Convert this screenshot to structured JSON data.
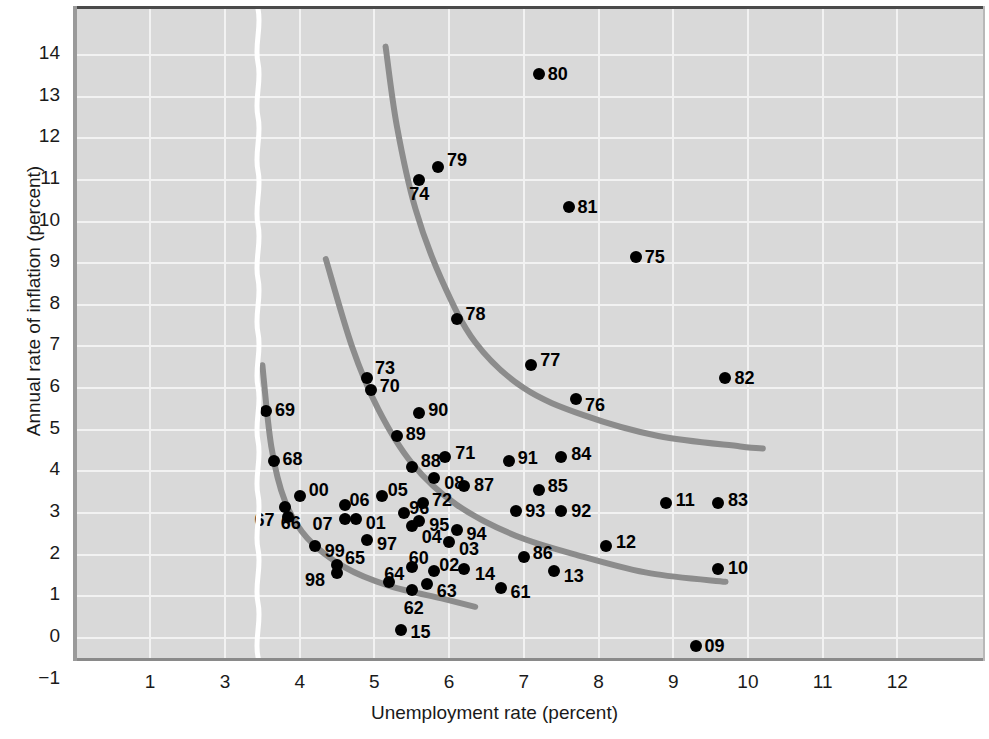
{
  "chart_data": {
    "type": "scatter",
    "title": "",
    "xlabel": "Unemployment rate (percent)",
    "ylabel": "Annual rate of inflation (percent)",
    "xlim": [
      0.4,
      12.7
    ],
    "ylim": [
      -1,
      14.7
    ],
    "xticks": [
      "1",
      "3",
      "4",
      "5",
      "6",
      "7",
      "8",
      "9",
      "10",
      "11",
      "12"
    ],
    "xtick_values": [
      1,
      3,
      4,
      5,
      6,
      7,
      8,
      9,
      10,
      11,
      12
    ],
    "yticks": [
      "14",
      "13",
      "12",
      "11",
      "10",
      "9",
      "8",
      "7",
      "6",
      "5",
      "4",
      "3",
      "2",
      "1",
      "0",
      "−1"
    ],
    "ytick_values": [
      14,
      13,
      12,
      11,
      10,
      9,
      8,
      7,
      6,
      5,
      4,
      3,
      2,
      1,
      0,
      -1
    ],
    "axis_break": {
      "present": true,
      "between": [
        1,
        3
      ],
      "style": "wavy-white-line"
    },
    "grid": true,
    "legend": null,
    "plot_bg_color": "#d9d9d9",
    "grid_color": "#f2f2f2",
    "point_color": "#000000",
    "curve_color": "#8c8c8c",
    "points": [
      {
        "label": "60",
        "x": 5.5,
        "y": 1.7
      },
      {
        "label": "61",
        "x": 6.7,
        "y": 1.2
      },
      {
        "label": "62",
        "x": 5.5,
        "y": 1.15
      },
      {
        "label": "63",
        "x": 5.7,
        "y": 1.3
      },
      {
        "label": "64",
        "x": 5.2,
        "y": 1.35
      },
      {
        "label": "65",
        "x": 4.5,
        "y": 1.75
      },
      {
        "label": "66",
        "x": 3.8,
        "y": 3.15
      },
      {
        "label": "67",
        "x": 3.85,
        "y": 2.9
      },
      {
        "label": "68",
        "x": 3.65,
        "y": 4.25
      },
      {
        "label": "69",
        "x": 3.55,
        "y": 5.45
      },
      {
        "label": "70",
        "x": 4.95,
        "y": 5.95
      },
      {
        "label": "71",
        "x": 5.95,
        "y": 4.35
      },
      {
        "label": "72",
        "x": 5.65,
        "y": 3.25
      },
      {
        "label": "73",
        "x": 4.9,
        "y": 6.25
      },
      {
        "label": "74",
        "x": 5.6,
        "y": 11.0
      },
      {
        "label": "75",
        "x": 8.5,
        "y": 9.15
      },
      {
        "label": "76",
        "x": 7.7,
        "y": 5.75
      },
      {
        "label": "77",
        "x": 7.1,
        "y": 6.55
      },
      {
        "label": "78",
        "x": 6.1,
        "y": 7.65
      },
      {
        "label": "79",
        "x": 5.85,
        "y": 11.3
      },
      {
        "label": "80",
        "x": 7.2,
        "y": 13.55
      },
      {
        "label": "81",
        "x": 7.6,
        "y": 10.35
      },
      {
        "label": "82",
        "x": 9.7,
        "y": 6.25
      },
      {
        "label": "83",
        "x": 9.6,
        "y": 3.25
      },
      {
        "label": "84",
        "x": 7.5,
        "y": 4.35
      },
      {
        "label": "85",
        "x": 7.2,
        "y": 3.55
      },
      {
        "label": "86",
        "x": 7.0,
        "y": 1.95
      },
      {
        "label": "87",
        "x": 6.2,
        "y": 3.65
      },
      {
        "label": "88",
        "x": 5.5,
        "y": 4.1
      },
      {
        "label": "89",
        "x": 5.3,
        "y": 4.85
      },
      {
        "label": "90",
        "x": 5.6,
        "y": 5.4
      },
      {
        "label": "91",
        "x": 6.8,
        "y": 4.25
      },
      {
        "label": "92",
        "x": 7.5,
        "y": 3.05
      },
      {
        "label": "93",
        "x": 6.9,
        "y": 3.05
      },
      {
        "label": "94",
        "x": 6.1,
        "y": 2.6
      },
      {
        "label": "95",
        "x": 5.6,
        "y": 2.8
      },
      {
        "label": "96",
        "x": 5.4,
        "y": 3.0
      },
      {
        "label": "97",
        "x": 4.9,
        "y": 2.35
      },
      {
        "label": "98",
        "x": 4.5,
        "y": 1.55
      },
      {
        "label": "99",
        "x": 4.2,
        "y": 2.2
      },
      {
        "label": "00",
        "x": 4.0,
        "y": 3.4
      },
      {
        "label": "01",
        "x": 4.75,
        "y": 2.85
      },
      {
        "label": "02",
        "x": 5.8,
        "y": 1.6
      },
      {
        "label": "03",
        "x": 6.0,
        "y": 2.3
      },
      {
        "label": "04",
        "x": 5.5,
        "y": 2.7
      },
      {
        "label": "05",
        "x": 5.1,
        "y": 3.4
      },
      {
        "label": "06",
        "x": 4.6,
        "y": 3.2
      },
      {
        "label": "07",
        "x": 4.6,
        "y": 2.85
      },
      {
        "label": "08",
        "x": 5.8,
        "y": 3.85
      },
      {
        "label": "09",
        "x": 9.3,
        "y": -0.2
      },
      {
        "label": "10",
        "x": 9.6,
        "y": 1.65
      },
      {
        "label": "11",
        "x": 8.9,
        "y": 3.25
      },
      {
        "label": "12",
        "x": 8.1,
        "y": 2.2
      },
      {
        "label": "13",
        "x": 7.4,
        "y": 1.6
      },
      {
        "label": "14",
        "x": 6.2,
        "y": 1.65
      },
      {
        "label": "15",
        "x": 5.35,
        "y": 0.2
      }
    ],
    "curves": [
      {
        "name": "short-run-phillips-curve-1960s",
        "points": [
          [
            3.5,
            6.55
          ],
          [
            3.62,
            4.6
          ],
          [
            3.8,
            3.3
          ],
          [
            4.1,
            2.4
          ],
          [
            4.6,
            1.7
          ],
          [
            5.2,
            1.25
          ],
          [
            5.9,
            0.95
          ],
          [
            6.35,
            0.75
          ]
        ]
      },
      {
        "name": "short-run-phillips-curve-1970s",
        "points": [
          [
            4.35,
            9.1
          ],
          [
            4.7,
            7.0
          ],
          [
            5.05,
            5.5
          ],
          [
            5.5,
            4.2
          ],
          [
            6.1,
            3.2
          ],
          [
            6.9,
            2.45
          ],
          [
            7.8,
            1.95
          ],
          [
            8.7,
            1.55
          ],
          [
            9.7,
            1.35
          ]
        ]
      },
      {
        "name": "short-run-phillips-curve-1980s",
        "points": [
          [
            5.15,
            14.2
          ],
          [
            5.3,
            12.3
          ],
          [
            5.55,
            10.3
          ],
          [
            5.9,
            8.6
          ],
          [
            6.35,
            7.1
          ],
          [
            7.0,
            6.0
          ],
          [
            7.8,
            5.35
          ],
          [
            8.8,
            4.85
          ],
          [
            9.9,
            4.6
          ],
          [
            10.2,
            4.55
          ]
        ]
      }
    ]
  }
}
